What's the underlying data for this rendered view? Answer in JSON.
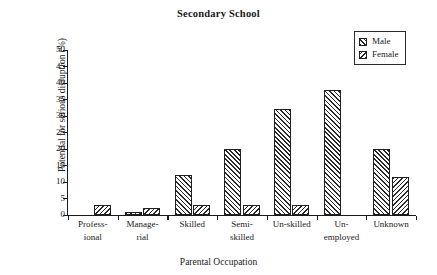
{
  "chart_data": {
    "type": "bar",
    "title": "Secondary School",
    "xlabel": "Parental Occupation",
    "ylabel": "Potential for serious disruption (%)",
    "ylim": [
      0,
      50
    ],
    "ytick_step": 5,
    "yticks": [
      0,
      5,
      10,
      15,
      20,
      25,
      30,
      35,
      40,
      45,
      50
    ],
    "grid": false,
    "legend_position": "top-right",
    "categories": [
      "Profess-\nional",
      "Manage-\nrial",
      "Skilled",
      "Semi-\nskilled",
      "Un-skilled",
      "Un-\nemployed",
      "Unknown"
    ],
    "category_lines": [
      [
        "Profess-",
        "ional"
      ],
      [
        "Manage-",
        "rial"
      ],
      [
        "Skilled",
        ""
      ],
      [
        "Semi-",
        "skilled"
      ],
      [
        "Un-skilled",
        ""
      ],
      [
        "Un-",
        "employed"
      ],
      [
        "Unknown",
        ""
      ]
    ],
    "series": [
      {
        "name": "Male",
        "fill": "hatch-fwd",
        "values": [
          0,
          1,
          12,
          20,
          32,
          38,
          20
        ]
      },
      {
        "name": "Female",
        "fill": "hatch-back",
        "values": [
          3,
          2,
          3,
          3,
          3,
          0,
          11.5
        ]
      }
    ]
  },
  "legend": {
    "items": [
      {
        "label": "Male",
        "swatch": "hatch-fwd"
      },
      {
        "label": "Female",
        "swatch": "hatch-back"
      }
    ]
  },
  "colors": {
    "axis": "#1a1a1a",
    "hatch": "#2a2a2a",
    "background": "#ffffff"
  }
}
